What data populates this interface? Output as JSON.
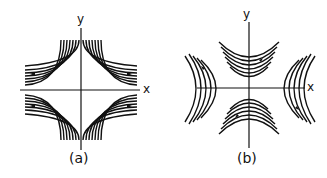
{
  "figure": {
    "panels": [
      {
        "id": "a",
        "caption": "(a)",
        "x_label": "x",
        "y_label": "y",
        "description": "Hyperbolic streamlines (saddle flow) in four quadrants, bounded by a square with concave corners"
      },
      {
        "id": "b",
        "caption": "(b)",
        "x_label": "x",
        "y_label": "y",
        "description": "Hyperbolic streamlines opening along both axes, bounded by an octagon-like region"
      }
    ],
    "colors": {
      "line": "#111111",
      "background": "#ffffff"
    }
  }
}
